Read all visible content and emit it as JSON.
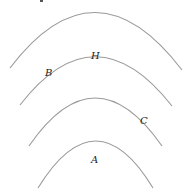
{
  "diagram": {
    "line_color": "#9a9a9a",
    "label_color": "#222222",
    "arcs": [
      {
        "id": "arc-1",
        "left": [
          10,
          68
        ],
        "apex": [
          95,
          12
        ],
        "right": [
          182,
          70
        ]
      },
      {
        "id": "arc-2",
        "left": [
          20,
          105
        ],
        "apex": [
          95,
          56
        ],
        "right": [
          172,
          106
        ]
      },
      {
        "id": "arc-3",
        "left": [
          29,
          146
        ],
        "apex": [
          95,
          98
        ],
        "right": [
          162,
          146
        ]
      },
      {
        "id": "arc-4",
        "left": [
          38,
          188
        ],
        "apex": [
          96,
          141
        ],
        "right": [
          153,
          188
        ]
      }
    ],
    "labels": [
      {
        "text": "H",
        "x": 91,
        "y": 51,
        "on": "arc-2"
      },
      {
        "text": "B",
        "x": 45,
        "y": 68,
        "on": "arc-2"
      },
      {
        "text": "C",
        "x": 140,
        "y": 116,
        "on": "arc-3"
      },
      {
        "text": "A",
        "x": 91,
        "y": 155,
        "inside": "arc-4"
      }
    ]
  }
}
